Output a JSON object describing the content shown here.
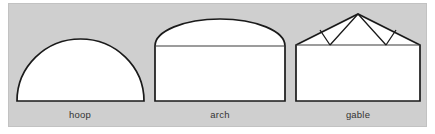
{
  "figure": {
    "panel": {
      "background_color": "#cfcfcf",
      "border_color": "#c2c2c2",
      "x": 8,
      "y": 3,
      "width": 419,
      "height": 124
    },
    "stroke_color": "#1a1a1a",
    "fill_color": "#ffffff",
    "divider_color": "#3a3a3a",
    "caption_color": "#333333",
    "shapes": [
      {
        "id": "hoop",
        "label": "hoop",
        "type": "semicircular-dome",
        "description": "half-round hoop house profile resting on a ground line",
        "geometry": {
          "base_left_x": 17,
          "base_right_x": 144,
          "base_y": 101,
          "span": 127,
          "apex_x": 80.5,
          "apex_y": 39,
          "rise": 62
        },
        "caption": {
          "x": 80,
          "y": 118
        }
      },
      {
        "id": "arch",
        "label": "arch",
        "type": "rectangle-with-domed-top",
        "description": "vertical side walls with a shallow curved arch roof and a horizontal eave line",
        "geometry": {
          "wall_left_x": 155,
          "wall_right_x": 285,
          "wall_bottom_y": 101,
          "eave_y": 46,
          "span": 130,
          "apex_x": 220,
          "apex_y": 19,
          "roof_rise": 27
        },
        "caption": {
          "x": 220,
          "y": 118
        }
      },
      {
        "id": "gable",
        "label": "gable",
        "type": "rectangle-with-trussed-gable-roof",
        "description": "vertical side walls with a peaked gable roof containing a king-post W truss",
        "geometry": {
          "wall_left_x": 296,
          "wall_right_x": 420,
          "wall_bottom_y": 101,
          "eave_y": 45,
          "span": 124,
          "apex_x": 358,
          "apex_y": 14,
          "roof_rise": 31,
          "truss_nodes": [
            {
              "name": "left-eave",
              "x": 296,
              "y": 45
            },
            {
              "name": "left-bottom-chord-node",
              "x": 330,
              "y": 45
            },
            {
              "name": "right-bottom-chord-node",
              "x": 386,
              "y": 45
            },
            {
              "name": "right-eave",
              "x": 420,
              "y": 45
            },
            {
              "name": "apex",
              "x": 358,
              "y": 14
            },
            {
              "name": "left-rafter-node",
              "x": 320,
              "y": 30
            },
            {
              "name": "right-rafter-node",
              "x": 396,
              "y": 30
            }
          ],
          "web_members": [
            "apex-to-left-bottom-chord-node",
            "apex-to-right-bottom-chord-node",
            "left-bottom-chord-node-to-left-rafter-node",
            "right-bottom-chord-node-to-right-rafter-node"
          ]
        },
        "caption": {
          "x": 358,
          "y": 118
        }
      }
    ]
  }
}
